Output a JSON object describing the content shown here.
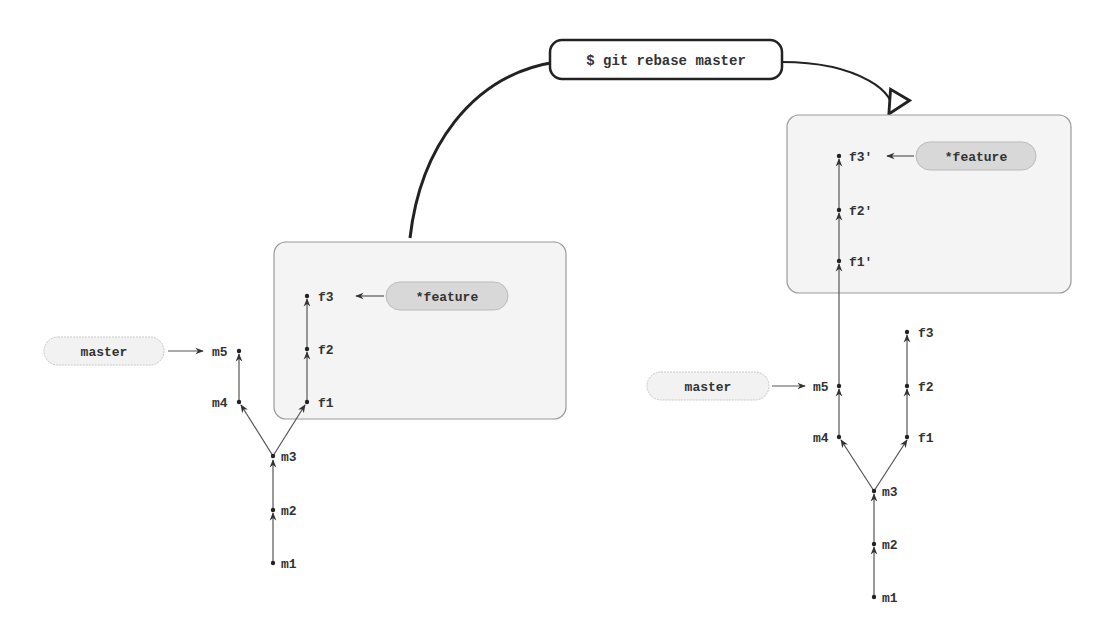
{
  "command": {
    "label": "$ git rebase master"
  },
  "before": {
    "master_label": "master",
    "feature_label": "*feature",
    "commits": {
      "m1": "m1",
      "m2": "m2",
      "m3": "m3",
      "m4": "m4",
      "m5": "m5",
      "f1": "f1",
      "f2": "f2",
      "f3": "f3"
    }
  },
  "after": {
    "master_label": "master",
    "feature_label": "*feature",
    "commits": {
      "m1": "m1",
      "m2": "m2",
      "m3": "m3",
      "m4": "m4",
      "m5": "m5",
      "f1": "f1",
      "f2": "f2",
      "f3": "f3",
      "f1p": "f1'",
      "f2p": "f2'",
      "f3p": "f3'"
    }
  },
  "colors": {
    "box_fill": "#f4f4f4",
    "box_stroke": "#9a9a9a",
    "feature_pill": "#d8d8d8",
    "master_pill": "#f2f2f2",
    "line": "#555555",
    "curve": "#222222"
  }
}
